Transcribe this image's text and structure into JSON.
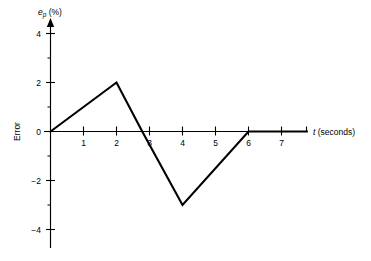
{
  "chart_data": {
    "type": "line",
    "title": "",
    "subtitle": "",
    "xlabel": "t (seconds)",
    "xlabel_symbol": "t",
    "xlabel_unit": "(seconds)",
    "ylabel": "Error",
    "ylabel_symbol": "e",
    "ylabel_subscript": "p",
    "ylabel_unit": "(%)",
    "ylabel_full": "e_p (%)",
    "x": [
      0,
      2,
      2.78,
      4,
      6,
      7.8
    ],
    "y": [
      0,
      2,
      0,
      -3,
      0,
      0
    ],
    "series": [
      {
        "name": "Error",
        "points": [
          {
            "x": 0,
            "y": 0
          },
          {
            "x": 2,
            "y": 2
          },
          {
            "x": 2.78,
            "y": 0
          },
          {
            "x": 4,
            "y": -3
          },
          {
            "x": 6,
            "y": 0
          },
          {
            "x": 7.8,
            "y": 0
          }
        ]
      }
    ],
    "xlim": [
      0,
      7.8
    ],
    "ylim": [
      -4.8,
      4.6
    ],
    "x_ticks_major": [
      1,
      2,
      3,
      4,
      5,
      6,
      7
    ],
    "x_tick_labels": [
      "1",
      "2",
      "3",
      "4",
      "5",
      "6",
      "7"
    ],
    "y_ticks_major": [
      4,
      2,
      0,
      -2,
      -4
    ],
    "y_tick_labels": [
      "4",
      "2",
      "0",
      "−2",
      "−4"
    ],
    "y_ticks_minor": [
      3,
      1,
      -1,
      -3
    ],
    "grid": false,
    "legend": false,
    "legend_position": "none",
    "line_color": "#000000",
    "axis_color": "#000000",
    "background_color": "#ffffff",
    "y_axis_arrow": true,
    "annotations": []
  },
  "axes": {
    "y_axis_caption_paren_open": "(",
    "y_axis_caption_paren_close": ")",
    "percent_symbol": "%"
  }
}
